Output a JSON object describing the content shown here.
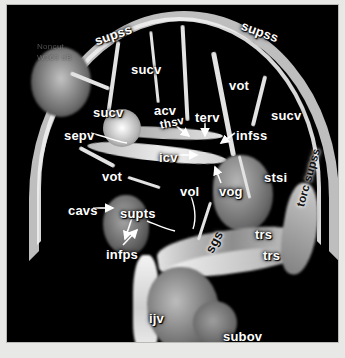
{
  "figure": {
    "modality": "MR venography maximum intensity projection",
    "view": "lateral",
    "background_color": "#000000",
    "label_color": "#ffffff",
    "frame_color": "#e8e8e6"
  },
  "scan_meta": {
    "line1": "Noncut",
    "line2": "W163 dB"
  },
  "annotations": [
    {
      "id": "supss-left",
      "text": "supss",
      "x": 86,
      "y": 30,
      "rotate": -19,
      "size": "normal",
      "leader": "none"
    },
    {
      "id": "supss-right",
      "text": "supss",
      "x": 237,
      "y": 14,
      "rotate": 20,
      "size": "normal",
      "leader": "none"
    },
    {
      "id": "sucv-top",
      "text": "sucv",
      "x": 124,
      "y": 58,
      "rotate": 0,
      "size": "normal",
      "leader": "none"
    },
    {
      "id": "sucv-left",
      "text": "sucv",
      "x": 86,
      "y": 101,
      "rotate": 0,
      "size": "normal",
      "leader": "none"
    },
    {
      "id": "sucv-right",
      "text": "sucv",
      "x": 264,
      "y": 104,
      "rotate": 0,
      "size": "normal",
      "leader": "none"
    },
    {
      "id": "acv",
      "text": "acv",
      "x": 147,
      "y": 99,
      "rotate": 0,
      "size": "normal",
      "leader": "none"
    },
    {
      "id": "terv",
      "text": "terv",
      "x": 188,
      "y": 106,
      "rotate": 0,
      "size": "normal",
      "leader": "arrow-down"
    },
    {
      "id": "sepv",
      "text": "sepv",
      "x": 57,
      "y": 124,
      "rotate": 0,
      "size": "normal",
      "leader": "curve-right"
    },
    {
      "id": "thsv",
      "text": "thsv",
      "x": 152,
      "y": 115,
      "rotate": -12,
      "size": "small",
      "leader": "arrow-down-right"
    },
    {
      "id": "icv",
      "text": "icv",
      "x": 152,
      "y": 146,
      "rotate": 0,
      "size": "normal",
      "leader": "arrow-right"
    },
    {
      "id": "infss",
      "text": "infss",
      "x": 229,
      "y": 124,
      "rotate": 0,
      "size": "normal",
      "leader": "arrow-left-down"
    },
    {
      "id": "vot-top",
      "text": "vot",
      "x": 222,
      "y": 74,
      "rotate": 0,
      "size": "normal",
      "leader": "none"
    },
    {
      "id": "vot-mid",
      "text": "vot",
      "x": 95,
      "y": 165,
      "rotate": 0,
      "size": "normal",
      "leader": "none"
    },
    {
      "id": "vol",
      "text": "vol",
      "x": 173,
      "y": 180,
      "rotate": 0,
      "size": "normal",
      "leader": "curve-down"
    },
    {
      "id": "vog",
      "text": "vog",
      "x": 212,
      "y": 180,
      "rotate": 0,
      "size": "normal",
      "leader": "arrow-up"
    },
    {
      "id": "stsi",
      "text": "stsi",
      "x": 257,
      "y": 166,
      "rotate": 0,
      "size": "normal",
      "leader": "none"
    },
    {
      "id": "cavs",
      "text": "cavs",
      "x": 61,
      "y": 199,
      "rotate": 0,
      "size": "normal",
      "leader": "arrow-right"
    },
    {
      "id": "supts",
      "text": "supts",
      "x": 113,
      "y": 202,
      "rotate": 0,
      "size": "normal",
      "leader": "arrow-down"
    },
    {
      "id": "infps",
      "text": "infps",
      "x": 99,
      "y": 243,
      "rotate": 0,
      "size": "normal",
      "leader": "arrow-up-right"
    },
    {
      "id": "trs-upper",
      "text": "trs",
      "x": 248,
      "y": 223,
      "rotate": 0,
      "size": "normal",
      "leader": "none"
    },
    {
      "id": "trs-lower",
      "text": "trs",
      "x": 256,
      "y": 244,
      "rotate": 0,
      "size": "normal",
      "leader": "none"
    },
    {
      "id": "sgs",
      "text": "sgs",
      "x": 196,
      "y": 244,
      "rotate": -62,
      "size": "normal",
      "leader": "none",
      "color": "dark"
    },
    {
      "id": "torc-supss",
      "text": "torc supss",
      "x": 288,
      "y": 200,
      "rotate": -74,
      "size": "small",
      "leader": "none",
      "color": "dark"
    },
    {
      "id": "ijv",
      "text": "ijv",
      "x": 142,
      "y": 307,
      "rotate": 0,
      "size": "normal",
      "leader": "none"
    },
    {
      "id": "subov",
      "text": "subov",
      "x": 216,
      "y": 325,
      "rotate": 0,
      "size": "normal",
      "leader": "none"
    }
  ],
  "abbreviations": {
    "supss": "superior sagittal sinus",
    "sucv": "superior cerebral vein",
    "acv": "anterior caudate vein",
    "terv": "terminal vein",
    "sepv": "septal vein",
    "thsv": "thalamostriate vein",
    "icv": "internal cerebral vein",
    "infss": "inferior sagittal sinus",
    "vot": "vein of Trolard",
    "vol": "vein of Labbe",
    "vog": "vein of Galen",
    "stsi": "straight sinus",
    "cavs": "cavernous sinus",
    "supts": "superior petrosal sinus",
    "infps": "inferior petrosal sinus",
    "trs": "transverse sinus",
    "sgs": "sigmoid sinus",
    "ijv": "internal jugular vein",
    "subov": "suboccipital venous plexus"
  }
}
